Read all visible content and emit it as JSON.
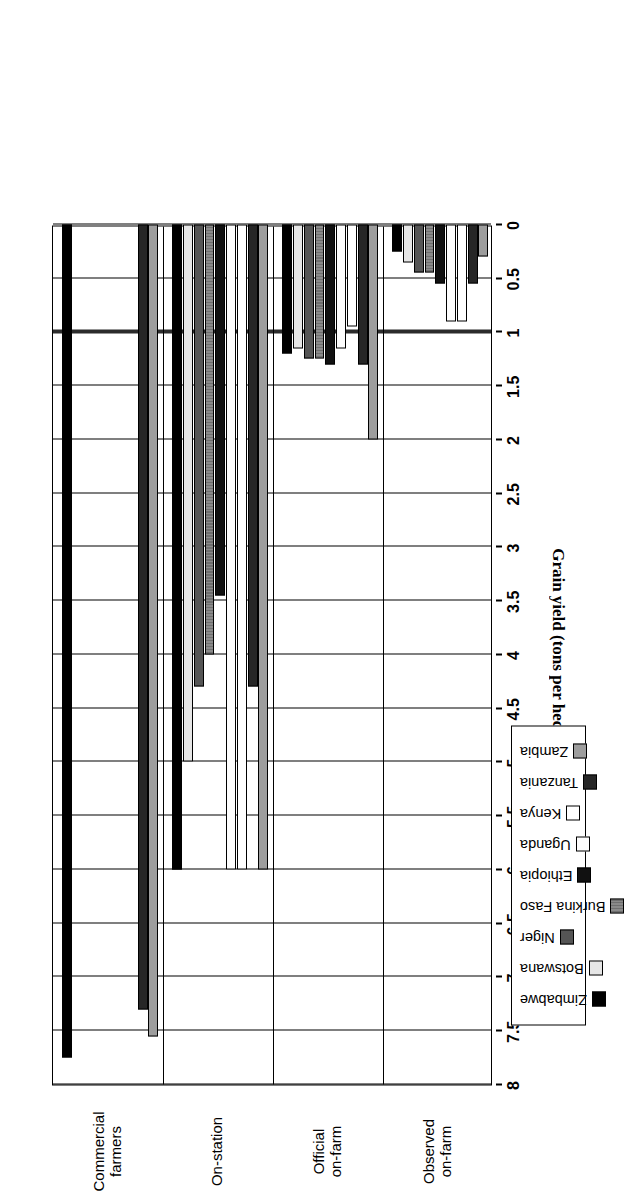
{
  "chart_data": {
    "type": "bar",
    "orientation": "horizontal-grouped",
    "title": "",
    "xlabel": "",
    "ylabel": "Grain yield (tons per hectare)",
    "axis_title": "Grain yield (tons per hectare)",
    "categories": [
      "Observed on-farm",
      "Official on-farm",
      "On-station",
      "Commercial farmers"
    ],
    "category_lines": [
      [
        "Observed",
        "on-farm"
      ],
      [
        "Official",
        "on-farm"
      ],
      [
        "On-station",
        ""
      ],
      [
        "Commercial",
        "farmers"
      ]
    ],
    "value_axis": {
      "min": 0,
      "max": 8,
      "tick_step": 0.5,
      "ticks": [
        8,
        7.5,
        7,
        6.5,
        6,
        5.5,
        5,
        4.5,
        4,
        3.5,
        3,
        2.5,
        2,
        1.5,
        1,
        0.5,
        0
      ],
      "tick_labels": [
        "8",
        "7.5",
        "7",
        "6.5",
        "6",
        "5.5",
        "5",
        "4.5",
        "4",
        "3.5",
        "3",
        "2.5",
        "2",
        "1.5",
        "1",
        "0.5",
        "0"
      ],
      "grid": true,
      "reference_line_value": 1
    },
    "legend": {
      "position": "below-right",
      "entries": [
        "Zambia",
        "Tanzania",
        "Kenya",
        "Uganda",
        "Ethiopia",
        "Burkina Faso",
        "Niger",
        "Botswana",
        "Zimbabwe"
      ]
    },
    "series": [
      {
        "name": "Zambia",
        "swatch_key": "zambia",
        "color": "#9d9d9d",
        "values": [
          0.3,
          2.0,
          6.0,
          7.55
        ]
      },
      {
        "name": "Tanzania",
        "swatch_key": "tanzania",
        "color": "#262626",
        "values": [
          0.55,
          1.3,
          4.3,
          7.3
        ]
      },
      {
        "name": "Kenya",
        "swatch_key": "kenya",
        "color": "#ffffff",
        "values": [
          0.9,
          0.95,
          6.0,
          0
        ]
      },
      {
        "name": "Uganda",
        "swatch_key": "uganda",
        "color": "#fdfdfd",
        "values": [
          0.9,
          1.15,
          6.0,
          0
        ]
      },
      {
        "name": "Ethiopia",
        "swatch_key": "ethiopia",
        "color": "#111111",
        "values": [
          0.55,
          1.3,
          3.45,
          0
        ]
      },
      {
        "name": "Burkina Faso",
        "swatch_key": "burkina",
        "color": "#8a8a8a",
        "values": [
          0.45,
          1.25,
          4.0,
          0
        ]
      },
      {
        "name": "Niger",
        "swatch_key": "niger",
        "color": "#555555",
        "values": [
          0.45,
          1.25,
          4.3,
          0
        ]
      },
      {
        "name": "Botswana",
        "swatch_key": "botswana",
        "color": "#e6e6e6",
        "values": [
          0.35,
          1.15,
          5.0,
          0
        ]
      },
      {
        "name": "Zimbabwe",
        "swatch_key": "zimbabwe",
        "color": "#000000",
        "values": [
          0.25,
          1.2,
          6.0,
          7.75
        ]
      }
    ]
  },
  "legend": {
    "items": [
      {
        "label": "Zambia",
        "key": "zambia"
      },
      {
        "label": "Tanzania",
        "key": "tanzania"
      },
      {
        "label": "Kenya",
        "key": "kenya"
      },
      {
        "label": "Uganda",
        "key": "uganda"
      },
      {
        "label": "Ethiopia",
        "key": "ethiopia"
      },
      {
        "label": "Burkina Faso",
        "key": "burkina"
      },
      {
        "label": "Niger",
        "key": "niger"
      },
      {
        "label": "Botswana",
        "key": "botswana"
      },
      {
        "label": "Zimbabwe",
        "key": "zimbabwe"
      }
    ]
  },
  "axis": {
    "title": "Grain yield (tons per hectare)"
  }
}
